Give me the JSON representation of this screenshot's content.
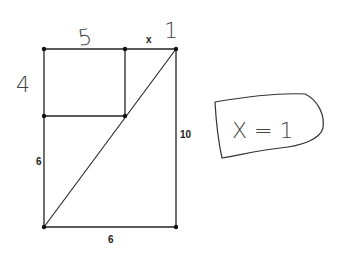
{
  "diagram": {
    "printed_labels": {
      "top_x": "x",
      "right_side": "10",
      "left_lower": "6",
      "bottom": "6"
    },
    "handwritten_labels": {
      "top_left_segment": "5",
      "top_right_segment": "1",
      "left_upper": "4",
      "answer": "X = 1"
    },
    "points": [
      {
        "name": "top-left",
        "x": 44,
        "y": 49
      },
      {
        "name": "top-mid",
        "x": 125,
        "y": 49
      },
      {
        "name": "top-right",
        "x": 176,
        "y": 49
      },
      {
        "name": "mid-left",
        "x": 44,
        "y": 116
      },
      {
        "name": "mid-inner",
        "x": 125,
        "y": 116
      },
      {
        "name": "bottom-left",
        "x": 44,
        "y": 227
      },
      {
        "name": "bottom-right",
        "x": 176,
        "y": 227
      }
    ],
    "stroke_color": "#222222"
  }
}
